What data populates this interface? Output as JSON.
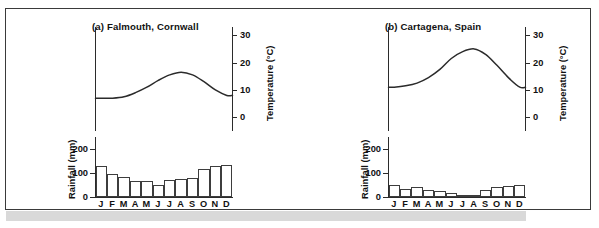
{
  "figure": {
    "background_color": "#ffffff",
    "frame_color": "#3a3a3a",
    "shadow_color": "#d9d9d9"
  },
  "axes": {
    "temperature_label": "Temperature (°C)",
    "rainfall_label": "Rainfall (mm)",
    "temperature_ticks": [
      "0",
      "10",
      "20",
      "30"
    ],
    "rainfall_ticks": [
      "0",
      "100",
      "200"
    ],
    "month_labels": [
      "J",
      "F",
      "M",
      "A",
      "M",
      "J",
      "J",
      "A",
      "S",
      "O",
      "N",
      "D"
    ]
  },
  "panels": [
    {
      "id": "a",
      "title": "(a)  Falmouth, Cornwall"
    },
    {
      "id": "b",
      "title": "(b)  Cartagena, Spain"
    }
  ],
  "chart_data": [
    {
      "type": "bar",
      "title": "(a)  Falmouth, Cornwall",
      "subtitle": "Climate graph: monthly rainfall bars with mean temperature curve",
      "xlabel": "",
      "ylabel": "Rainfall (mm)",
      "y2label": "Temperature (°C)",
      "categories": [
        "J",
        "F",
        "M",
        "A",
        "M",
        "J",
        "J",
        "A",
        "S",
        "O",
        "N",
        "D"
      ],
      "ylim": [
        0,
        250
      ],
      "y2lim": [
        -5,
        33
      ],
      "yticks": [
        0,
        100,
        200
      ],
      "y2ticks": [
        0,
        10,
        20,
        30
      ],
      "grid": false,
      "legend": "none",
      "series": [
        {
          "name": "Rainfall",
          "type": "bar",
          "unit": "mm",
          "values": [
            130,
            95,
            82,
            68,
            68,
            50,
            70,
            75,
            80,
            115,
            130,
            135
          ]
        },
        {
          "name": "Temperature",
          "type": "line",
          "unit": "°C",
          "values": [
            7.0,
            7.0,
            7.5,
            9.0,
            11.0,
            13.5,
            15.5,
            16.5,
            15.5,
            13.0,
            10.0,
            8.0
          ]
        }
      ]
    },
    {
      "type": "bar",
      "title": "(b)  Cartagena, Spain",
      "subtitle": "Climate graph: monthly rainfall bars with mean temperature curve",
      "xlabel": "",
      "ylabel": "Rainfall (mm)",
      "y2label": "Temperature (°C)",
      "categories": [
        "J",
        "F",
        "M",
        "A",
        "M",
        "J",
        "J",
        "A",
        "S",
        "O",
        "N",
        "D"
      ],
      "ylim": [
        0,
        250
      ],
      "y2lim": [
        -5,
        33
      ],
      "yticks": [
        0,
        100,
        200
      ],
      "y2ticks": [
        0,
        10,
        20,
        30
      ],
      "grid": false,
      "legend": "none",
      "series": [
        {
          "name": "Rainfall",
          "type": "bar",
          "unit": "mm",
          "values": [
            48,
            33,
            42,
            30,
            24,
            16,
            2,
            3,
            30,
            42,
            47,
            52
          ]
        },
        {
          "name": "Temperature",
          "type": "line",
          "unit": "°C",
          "values": [
            11.0,
            11.5,
            12.5,
            14.5,
            17.5,
            21.5,
            24.0,
            25.0,
            23.0,
            19.0,
            14.5,
            11.0
          ]
        }
      ]
    }
  ]
}
